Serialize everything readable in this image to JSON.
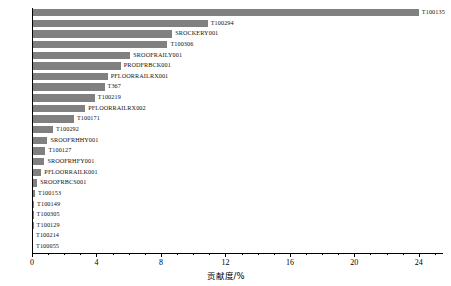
{
  "chart_data": {
    "type": "bar",
    "orientation": "horizontal",
    "title": "",
    "xlabel": "贡献度/%",
    "ylabel": "",
    "xlim": [
      0,
      25.5
    ],
    "xticks": [
      0,
      4,
      8,
      12,
      16,
      20,
      24
    ],
    "xtick_labels": [
      "0",
      "4",
      "8",
      "12",
      "16",
      "20",
      "24"
    ],
    "grid": false,
    "legend": null,
    "categories": [
      "T100135",
      "T100294",
      "SROCKERY001",
      "T100306",
      "SROOFRAILY001",
      "PRODFRBCK001",
      "PFLOORRAILRX001",
      "T367",
      "T100219",
      "PFLOORRAILRX002",
      "T100171",
      "T100292",
      "SROOFRHHY001",
      "T100127",
      "SROOFRHFY001",
      "PFLOORRAILK001",
      "SROOFRBCS001",
      "T100153",
      "T100149",
      "T100305",
      "T100129",
      "T100214",
      "T100055"
    ],
    "values": [
      24.0,
      10.9,
      8.7,
      8.4,
      6.1,
      5.5,
      4.7,
      4.5,
      3.9,
      3.3,
      2.6,
      1.3,
      0.96,
      0.83,
      0.77,
      0.58,
      0.32,
      0.19,
      0.13,
      0.1,
      0.1,
      0.06,
      0.06
    ],
    "bar_color": "#808080"
  }
}
